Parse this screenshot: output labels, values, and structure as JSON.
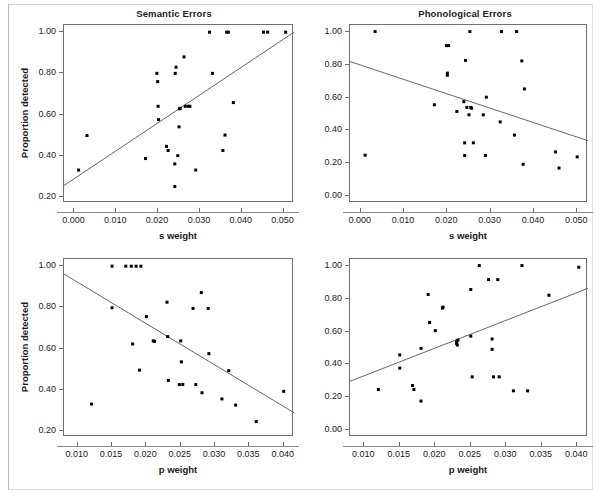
{
  "figure": {
    "panel_count": 4,
    "marker_color": "#000000",
    "line_color": "#555555",
    "axis_color": "#6f6f6f",
    "background": "#ffffff"
  },
  "chart_data": [
    {
      "id": "top-left",
      "type": "scatter",
      "title": "Semantic Errors",
      "xlabel": "s weight",
      "ylabel": "Proportion detected",
      "xlim": [
        -0.0025,
        0.0525
      ],
      "ylim": [
        0.17,
        1.035
      ],
      "grid": false,
      "legend": "none",
      "xticks": [
        0.0,
        0.01,
        0.02,
        0.03,
        0.04,
        0.05
      ],
      "xticklabels": [
        "0.000",
        "0.010",
        "0.020",
        "0.030",
        "0.040",
        "0.050"
      ],
      "yticks": [
        0.2,
        0.4,
        0.6,
        0.8,
        1.0
      ],
      "yticklabels": [
        "0.20",
        "0.40",
        "0.60",
        "0.80",
        "1.00"
      ],
      "x": [
        0.001,
        0.003,
        0.017,
        0.0197,
        0.0199,
        0.02,
        0.0201,
        0.022,
        0.0224,
        0.024,
        0.024,
        0.0241,
        0.0243,
        0.0247,
        0.025,
        0.0251,
        0.0253,
        0.0262,
        0.0265,
        0.0272,
        0.0276,
        0.029,
        0.0323,
        0.033,
        0.0355,
        0.036,
        0.0364,
        0.0368,
        0.038,
        0.0452,
        0.0462,
        0.0505
      ],
      "y": [
        0.33,
        0.498,
        0.386,
        0.8,
        0.76,
        0.64,
        0.575,
        0.445,
        0.425,
        0.36,
        0.25,
        0.8,
        0.83,
        0.4,
        0.54,
        0.628,
        0.63,
        0.88,
        0.64,
        0.64,
        0.64,
        0.33,
        1.0,
        0.8,
        0.425,
        0.5,
        1.0,
        1.0,
        0.658,
        1.0,
        1.0,
        1.0
      ],
      "trend_line": {
        "x0": -0.0025,
        "y0": 0.255,
        "x1": 0.0525,
        "y1": 1.0
      },
      "trend_direction": "positive"
    },
    {
      "id": "top-right",
      "type": "scatter",
      "title": "Phonological Errors",
      "xlabel": "s weight",
      "ylabel": "",
      "xlim": [
        -0.0025,
        0.0525
      ],
      "ylim": [
        -0.04,
        1.04
      ],
      "grid": false,
      "legend": "none",
      "xticks": [
        0.0,
        0.01,
        0.02,
        0.03,
        0.04,
        0.05
      ],
      "xticklabels": [
        "0.000",
        "0.010",
        "0.020",
        "0.030",
        "0.040",
        "0.050"
      ],
      "yticks": [
        0.0,
        0.2,
        0.4,
        0.6,
        0.8,
        1.0
      ],
      "yticklabels": [
        "0.00",
        "0.20",
        "0.40",
        "0.60",
        "0.80",
        "1.00"
      ],
      "x": [
        0.001,
        0.0033,
        0.017,
        0.0198,
        0.0203,
        0.02,
        0.02,
        0.0222,
        0.0238,
        0.024,
        0.024,
        0.0242,
        0.0245,
        0.025,
        0.0252,
        0.0254,
        0.0256,
        0.026,
        0.0283,
        0.0288,
        0.029,
        0.0322,
        0.0325,
        0.0355,
        0.036,
        0.0372,
        0.0375,
        0.0378,
        0.045,
        0.0458,
        0.05
      ],
      "y": [
        0.25,
        1.0,
        0.556,
        0.915,
        0.915,
        0.748,
        0.735,
        0.515,
        0.575,
        0.325,
        0.248,
        0.825,
        0.54,
        0.495,
        1.0,
        0.54,
        0.535,
        0.325,
        0.495,
        0.248,
        0.602,
        0.452,
        1.0,
        0.372,
        1.0,
        0.822,
        0.195,
        0.652,
        0.27,
        0.172,
        0.24
      ],
      "trend_line": {
        "x0": -0.0025,
        "y0": 0.818,
        "x1": 0.0525,
        "y1": 0.338
      },
      "trend_direction": "negative"
    },
    {
      "id": "bottom-left",
      "type": "scatter",
      "title": "",
      "xlabel": "p weight",
      "ylabel": "Proportion detected",
      "xlim": [
        0.008,
        0.0415
      ],
      "ylim": [
        0.17,
        1.035
      ],
      "grid": false,
      "legend": "none",
      "xticks": [
        0.01,
        0.015,
        0.02,
        0.025,
        0.03,
        0.035,
        0.04
      ],
      "xticklabels": [
        "0.010",
        "0.015",
        "0.020",
        "0.025",
        "0.030",
        "0.035",
        "0.040"
      ],
      "yticks": [
        0.2,
        0.4,
        0.6,
        0.8,
        1.0
      ],
      "yticklabels": [
        "0.20",
        "0.40",
        "0.60",
        "0.80",
        "1.00"
      ],
      "x": [
        0.012,
        0.015,
        0.015,
        0.017,
        0.0178,
        0.0185,
        0.0192,
        0.018,
        0.019,
        0.02,
        0.021,
        0.0212,
        0.023,
        0.0231,
        0.0232,
        0.0248,
        0.025,
        0.0251,
        0.0253,
        0.0268,
        0.0272,
        0.028,
        0.0281,
        0.029,
        0.0291,
        0.031,
        0.032,
        0.033,
        0.036,
        0.04
      ],
      "y": [
        0.33,
        1.0,
        0.798,
        1.0,
        1.0,
        1.0,
        1.0,
        0.622,
        0.495,
        0.755,
        0.637,
        0.635,
        0.825,
        0.658,
        0.445,
        0.425,
        0.637,
        0.535,
        0.425,
        0.795,
        0.425,
        0.872,
        0.385,
        0.795,
        0.575,
        0.355,
        0.492,
        0.325,
        0.245,
        0.392
      ],
      "trend_line": {
        "x0": 0.008,
        "y0": 0.962,
        "x1": 0.0415,
        "y1": 0.288
      },
      "trend_direction": "negative"
    },
    {
      "id": "bottom-right",
      "type": "scatter",
      "title": "",
      "xlabel": "p weight",
      "ylabel": "",
      "xlim": [
        0.008,
        0.0415
      ],
      "ylim": [
        -0.04,
        1.04
      ],
      "grid": false,
      "legend": "none",
      "xticks": [
        0.01,
        0.015,
        0.02,
        0.025,
        0.03,
        0.035,
        0.04
      ],
      "xticklabels": [
        "0.010",
        "0.015",
        "0.020",
        "0.025",
        "0.030",
        "0.035",
        "0.040"
      ],
      "yticks": [
        0.0,
        0.2,
        0.4,
        0.6,
        0.8,
        1.0
      ],
      "yticklabels": [
        "0.00",
        "0.20",
        "0.40",
        "0.60",
        "0.80",
        "1.00"
      ],
      "x": [
        0.012,
        0.015,
        0.015,
        0.0168,
        0.017,
        0.018,
        0.018,
        0.019,
        0.0192,
        0.02,
        0.021,
        0.0211,
        0.023,
        0.023,
        0.0231,
        0.0232,
        0.025,
        0.025,
        0.0252,
        0.0262,
        0.0275,
        0.028,
        0.028,
        0.0282,
        0.0288,
        0.029,
        0.031,
        0.0322,
        0.033,
        0.036,
        0.0402
      ],
      "y": [
        0.248,
        0.458,
        0.378,
        0.272,
        0.248,
        0.498,
        0.178,
        0.825,
        0.655,
        0.605,
        0.742,
        0.748,
        0.538,
        0.528,
        0.518,
        0.548,
        0.855,
        0.572,
        0.325,
        1.0,
        0.915,
        0.555,
        0.492,
        0.325,
        0.915,
        0.325,
        0.24,
        1.0,
        0.24,
        0.82,
        0.99
      ],
      "trend_line": {
        "x0": 0.008,
        "y0": 0.298,
        "x1": 0.0415,
        "y1": 0.862
      },
      "trend_direction": "positive"
    }
  ]
}
